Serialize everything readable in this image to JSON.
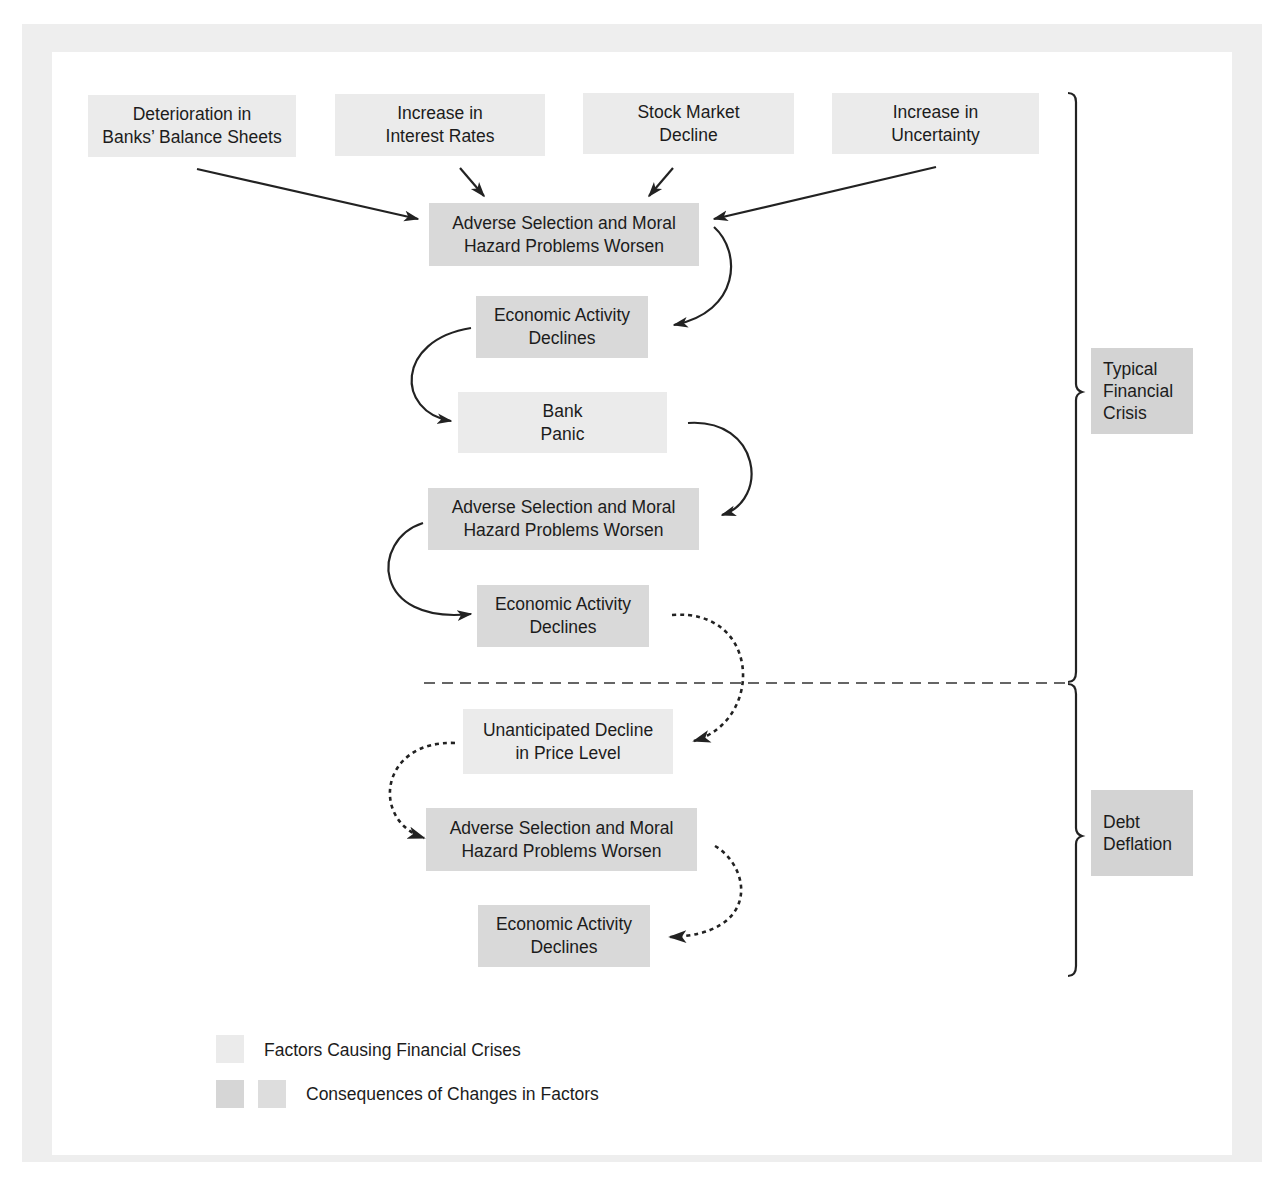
{
  "diagram": {
    "factors_top": [
      {
        "id": "f1",
        "label": "Deterioration in\nBanks’ Balance Sheets"
      },
      {
        "id": "f2",
        "label": "Increase in\nInterest Rates"
      },
      {
        "id": "f3",
        "label": "Stock Market\nDecline"
      },
      {
        "id": "f4",
        "label": "Increase in\nUncertainty"
      }
    ],
    "flow": [
      {
        "id": "c1",
        "type": "consequence",
        "label": "Adverse Selection and Moral\nHazard Problems Worsen"
      },
      {
        "id": "c2",
        "type": "consequence",
        "label": "Economic Activity\nDeclines"
      },
      {
        "id": "f5",
        "type": "factor",
        "label": "Bank\nPanic"
      },
      {
        "id": "c3",
        "type": "consequence",
        "label": "Adverse Selection and Moral\nHazard Problems Worsen"
      },
      {
        "id": "c4",
        "type": "consequence",
        "label": "Economic Activity\nDeclines"
      },
      {
        "id": "f6",
        "type": "factor",
        "label": "Unanticipated Decline\nin Price Level"
      },
      {
        "id": "c5",
        "type": "consequence",
        "label": "Adverse Selection and Moral\nHazard Problems Worsen"
      },
      {
        "id": "c6",
        "type": "consequence",
        "label": "Economic Activity\nDeclines"
      }
    ],
    "stages": [
      {
        "id": "typical",
        "label": "Typical\nFinancial\nCrisis"
      },
      {
        "id": "debt",
        "label": "Debt\nDeflation"
      }
    ],
    "edges": [
      {
        "from": "f1",
        "to": "c1",
        "style": "solid"
      },
      {
        "from": "f2",
        "to": "c1",
        "style": "solid"
      },
      {
        "from": "f3",
        "to": "c1",
        "style": "solid"
      },
      {
        "from": "f4",
        "to": "c1",
        "style": "solid"
      },
      {
        "from": "c1",
        "to": "c2",
        "style": "solid"
      },
      {
        "from": "c2",
        "to": "f5",
        "style": "solid"
      },
      {
        "from": "f5",
        "to": "c3",
        "style": "solid"
      },
      {
        "from": "c3",
        "to": "c4",
        "style": "solid"
      },
      {
        "from": "c4",
        "to": "f6",
        "style": "dashed"
      },
      {
        "from": "f6",
        "to": "c5",
        "style": "dashed"
      },
      {
        "from": "c5",
        "to": "c6",
        "style": "dashed"
      }
    ]
  },
  "legend": {
    "factors_label": "Factors Causing Financial Crises",
    "consequences_label": "Consequences of Changes in Factors"
  },
  "colors": {
    "factor_fill": "#ebebeb",
    "consequence_fill": "#d9d9d9",
    "stage_fill": "#d3d3d3",
    "frame": "#eeeeee",
    "stroke": "#222222"
  }
}
